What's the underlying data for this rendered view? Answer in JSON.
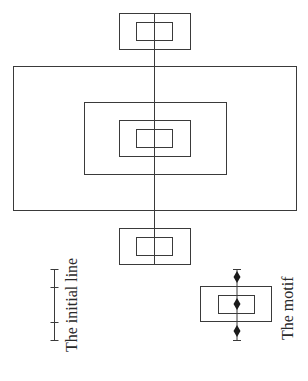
{
  "diagram": {
    "labels": {
      "initial_line": "The initial line",
      "motif": "The motif"
    },
    "colors": {
      "stroke": "#3a3a3a",
      "background": "#ffffff",
      "diamond": "#1a1a1a"
    },
    "axis_line": {
      "x": 154.5,
      "y1": 13,
      "y2": 264
    },
    "rectangles": [
      {
        "name": "top-outer-rect",
        "x": 119.5,
        "y": 13.5,
        "w": 71,
        "h": 36
      },
      {
        "name": "top-inner-rect",
        "x": 136.5,
        "y": 22.5,
        "w": 36,
        "h": 18
      },
      {
        "name": "large-outer-rect",
        "x": 13.5,
        "y": 66.5,
        "w": 283,
        "h": 144
      },
      {
        "name": "middle-rect",
        "x": 84.5,
        "y": 102.5,
        "w": 142,
        "h": 72
      },
      {
        "name": "center-outer-rect",
        "x": 119.5,
        "y": 120.5,
        "w": 71,
        "h": 36
      },
      {
        "name": "center-inner-rect",
        "x": 136.5,
        "y": 129.5,
        "w": 36,
        "h": 18
      },
      {
        "name": "bottom-outer-rect",
        "x": 119.5,
        "y": 228.5,
        "w": 71,
        "h": 36
      },
      {
        "name": "bottom-inner-rect",
        "x": 136.5,
        "y": 237.5,
        "w": 36,
        "h": 18
      }
    ],
    "initial_line": {
      "x": 54.5,
      "y1": 269,
      "y2": 340,
      "ticks": [
        269,
        287,
        322,
        340
      ]
    },
    "motif": {
      "outer": {
        "x": 200.5,
        "y": 286.5,
        "w": 71,
        "h": 35
      },
      "inner": {
        "x": 218.5,
        "y": 295.5,
        "w": 36,
        "h": 18
      },
      "line": {
        "x": 237,
        "y1": 269,
        "y2": 340
      },
      "diamonds": [
        277,
        304,
        331
      ]
    }
  }
}
